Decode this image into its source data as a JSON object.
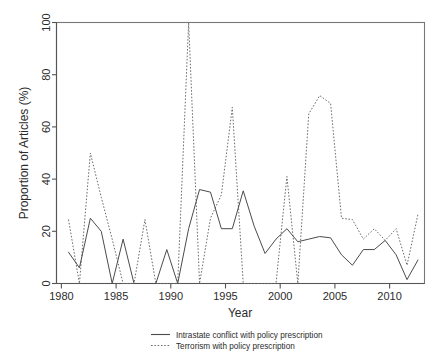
{
  "chart_data": {
    "type": "line",
    "title": "",
    "xlabel": "Year",
    "ylabel": "Proportion of Articles (%)",
    "xlim": [
      1979.4,
      1992.6
    ],
    "ylim": [
      0,
      100
    ],
    "xticks": [
      1980,
      1985,
      1990,
      1995,
      2000,
      2005,
      2010
    ],
    "yticks": [
      0,
      20,
      40,
      60,
      80,
      100
    ],
    "grid": false,
    "legend_position": "below-axis-centered",
    "x": [
      1980,
      1981,
      1982,
      1983,
      1984,
      1985,
      1986,
      1987,
      1988,
      1989,
      1990,
      1991,
      1992,
      1993,
      1994,
      1995,
      1996,
      1997,
      1998,
      1999,
      2000,
      2001,
      2002,
      2003,
      2004,
      2005,
      2006,
      2007,
      2008,
      2009,
      2010,
      2011,
      2012
    ],
    "series": [
      {
        "name": "Intrastate conflict with policy prescription",
        "style": "solid",
        "color": "#4b4b4b",
        "values": [
          12,
          6,
          25,
          20,
          0,
          17,
          0,
          0,
          0,
          13,
          0,
          21,
          36,
          35,
          21,
          21,
          35.5,
          22,
          11.5,
          17,
          21,
          16,
          17,
          18,
          17.5,
          11,
          7,
          13,
          13,
          16.5,
          11,
          1.5,
          9
        ]
      },
      {
        "name": "Terrorism with policy prescription",
        "style": "dotted",
        "color": "#6d6d6d",
        "values": [
          24.5,
          0,
          50,
          33,
          17,
          0,
          0,
          24.5,
          0,
          0,
          0,
          100,
          0,
          25,
          34,
          67.5,
          0,
          0,
          0,
          0,
          41,
          0,
          65,
          72,
          69,
          25,
          24.5,
          17,
          21,
          16.5,
          21,
          7,
          26.5
        ]
      }
    ]
  },
  "axis": {
    "x_tick_labels": [
      "1980",
      "1985",
      "1990",
      "1995",
      "2000",
      "2005",
      "2010"
    ],
    "y_tick_labels": [
      "0",
      "20",
      "40",
      "60",
      "80",
      "100"
    ],
    "x_title": "Year",
    "y_title": "Proportion of Articles (%)"
  },
  "legend": {
    "entries": [
      {
        "label": "Intrastate conflict with policy prescription",
        "style": "solid"
      },
      {
        "label": "Terrorism with policy prescription",
        "style": "dotted"
      }
    ]
  },
  "colors": {
    "solid_series": "#4b4b4b",
    "dotted_series": "#6d6d6d",
    "axis": "#555555",
    "frame": "#777777",
    "background": "#ffffff",
    "text": "#2b2b2b"
  }
}
